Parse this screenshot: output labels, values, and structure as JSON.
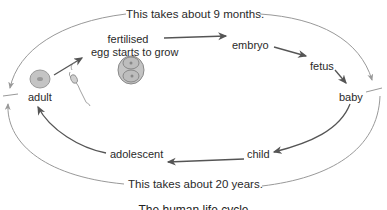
{
  "diagram": {
    "caption": "The human life cycle",
    "top_duration": "This takes about 9 months.",
    "bottom_duration": "This takes about 20 years.",
    "stages": [
      {
        "id": "adult",
        "label": "adult"
      },
      {
        "id": "fertilised-egg",
        "label": "fertilised\negg starts to grow",
        "line1": "fertilised",
        "line2": "egg starts to grow"
      },
      {
        "id": "embryo",
        "label": "embryo"
      },
      {
        "id": "fetus",
        "label": "fetus"
      },
      {
        "id": "baby",
        "label": "baby"
      },
      {
        "id": "child",
        "label": "child"
      },
      {
        "id": "adolescent",
        "label": "adolescent"
      }
    ],
    "colors": {
      "inner_arrow": "#555555",
      "outer_arc": "#999999",
      "cell_fill": "#bdbdbd",
      "cell_stroke": "#8a8a8a"
    }
  }
}
